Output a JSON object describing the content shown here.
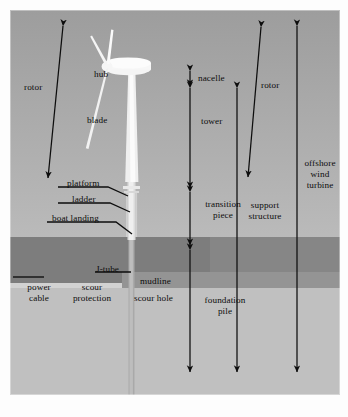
{
  "figure": {
    "canvas": {
      "width": 348,
      "height": 417
    },
    "colors": {
      "sky_top": "#9d9d9d",
      "sky_bottom": "#bcbcbc",
      "water": "#868686",
      "water_left": "#7d7d7d",
      "seabed": "#c0c0c0",
      "scour_protection": "#d2d2d2",
      "scour_hole": "#949494",
      "turbine": "#f2f2f2",
      "annotation": "#0d0d0d"
    }
  },
  "labels": {
    "rotor_left": "rotor",
    "hub": "hub",
    "blade": "blade",
    "platform": "platform",
    "ladder": "ladder",
    "boat_landing": "boat landing",
    "power_cable_l1": "power",
    "power_cable_l2": "cable",
    "scour_protection_l1": "scour",
    "scour_protection_l2": "protection",
    "j_tube": "J-tube",
    "mudline": "mudline",
    "scour_hole": "scour hole",
    "nacelle": "nacelle",
    "tower": "tower",
    "transition_l1": "transition",
    "transition_l2": "piece",
    "foundation_l1": "foundation",
    "foundation_l2": "pile",
    "rotor_right": "rotor",
    "support_l1": "support",
    "support_l2": "structure",
    "offshore_l1": "offshore",
    "offshore_l2": "wind",
    "offshore_l3": "turbine"
  },
  "annotations": {
    "dimension_arrows": [
      {
        "name": "rotor-left",
        "type": "double",
        "x1": 63,
        "y1": 26,
        "x2": 48,
        "y2": 178
      },
      {
        "name": "nacelle",
        "type": "double",
        "x1": 190,
        "y1": 71,
        "x2": 190,
        "y2": 86
      },
      {
        "name": "tower",
        "type": "double",
        "x1": 190,
        "y1": 88,
        "x2": 190,
        "y2": 188
      },
      {
        "name": "transition-piece",
        "type": "double",
        "x1": 190,
        "y1": 192,
        "x2": 190,
        "y2": 245
      },
      {
        "name": "foundation-pile",
        "type": "double",
        "x1": 190,
        "y1": 250,
        "x2": 190,
        "y2": 372
      },
      {
        "name": "rotor-right",
        "type": "double",
        "x1": 261,
        "y1": 27,
        "x2": 248,
        "y2": 177
      },
      {
        "name": "support-structure",
        "type": "double",
        "x1": 237,
        "y1": 88,
        "x2": 237,
        "y2": 372
      },
      {
        "name": "offshore-wind-turbine",
        "type": "double",
        "x1": 297,
        "y1": 26,
        "x2": 297,
        "y2": 372
      }
    ],
    "leader_lines": [
      {
        "name": "platform",
        "points": "58,187 108,187 128,196"
      },
      {
        "name": "ladder",
        "points": "58,203 110,203 130,212"
      },
      {
        "name": "boat-landing",
        "points": "47,222 116,222 132,234"
      },
      {
        "name": "power-cable",
        "points": "13,277 44,277"
      },
      {
        "name": "j-tube",
        "points": "95,272 131,272"
      }
    ]
  }
}
